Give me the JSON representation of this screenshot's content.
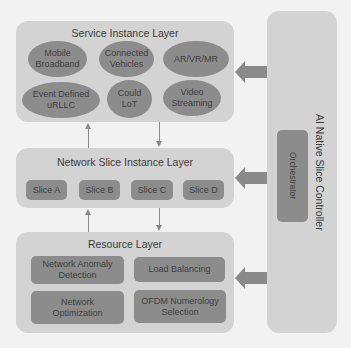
{
  "service_layer": {
    "title": "Service Instance Layer",
    "services": [
      {
        "line1": "Mobile",
        "line2": "Broadband"
      },
      {
        "line1": "Connected",
        "line2": "Vehicles"
      },
      {
        "line1": "AR/VR/MR",
        "line2": ""
      },
      {
        "line1": "Event Defined",
        "line2": "uRLLC"
      },
      {
        "line1": "Could",
        "line2": "LoT"
      },
      {
        "line1": "Video",
        "line2": "Streaming"
      }
    ]
  },
  "slice_layer": {
    "title": "Network Slice Instance Layer",
    "slices": [
      "Slice A",
      "Slice B",
      "Slice C",
      "Slice D"
    ]
  },
  "resource_layer": {
    "title": "Resource Layer",
    "functions": [
      {
        "line1": "Network Anomaly",
        "line2": "Detection"
      },
      {
        "line1": "Load Balancing",
        "line2": ""
      },
      {
        "line1": "Network",
        "line2": "Optimization"
      },
      {
        "line1": "OFDM Numerology",
        "line2": "Selection"
      }
    ]
  },
  "controller": {
    "title": "AI Native Slice Controller",
    "orchestrator": "Orchestrator"
  },
  "colors": {
    "background": "#f2f2f2",
    "panel": "#d3d3d3",
    "component": "#8c8c8c",
    "arrow": "#8a8a8a",
    "text": "#3a3a3a"
  }
}
